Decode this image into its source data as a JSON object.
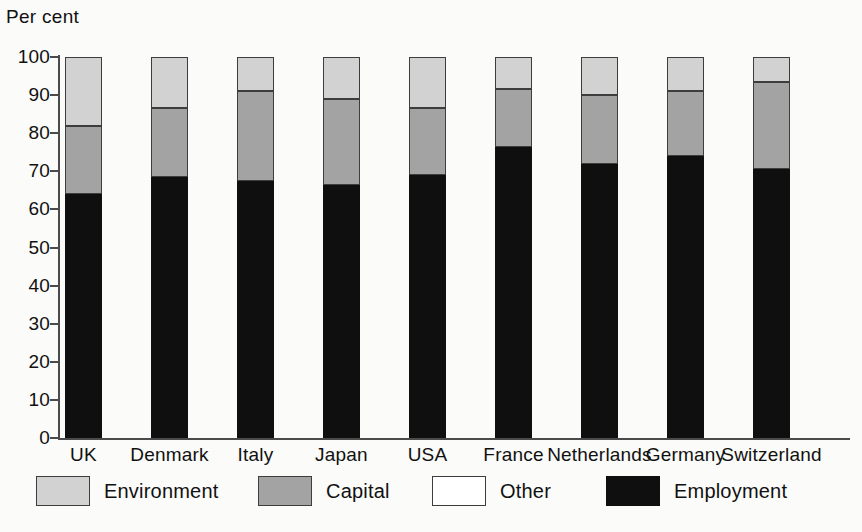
{
  "chart_data": {
    "type": "bar",
    "subtype": "stacked-vertical-100",
    "title": "",
    "xlabel": "",
    "ylabel": "Per cent",
    "ylim": [
      0,
      100
    ],
    "yticks": [
      0,
      10,
      20,
      30,
      40,
      50,
      60,
      70,
      80,
      90,
      100
    ],
    "ytick_labels": [
      "0",
      "10",
      "20",
      "30",
      "40",
      "50",
      "60",
      "70",
      "80",
      "90",
      "100"
    ],
    "grid": false,
    "legend_position": "bottom",
    "categories": [
      "UK",
      "Denmark",
      "Italy",
      "Japan",
      "USA",
      "France",
      "Netherlands",
      "Germany",
      "Switzerland"
    ],
    "series": [
      {
        "name": "Employment",
        "color": "#100f0f",
        "values": [
          64,
          68.5,
          67.5,
          66.5,
          69,
          76.5,
          72,
          74,
          70.5
        ]
      },
      {
        "name": "Capital",
        "color": "#a3a3a3",
        "values": [
          18,
          18,
          23.5,
          22.5,
          17.5,
          15,
          18,
          17,
          23
        ]
      },
      {
        "name": "Other",
        "color": "#ffffff",
        "values": [
          0,
          0,
          0,
          0,
          0,
          0,
          0,
          0,
          0
        ]
      },
      {
        "name": "Environment",
        "color": "#d2d2d2",
        "values": [
          18,
          13.5,
          9,
          11,
          13.5,
          8.5,
          10,
          9,
          6.5
        ]
      }
    ],
    "stack_order_bottom_to_top": [
      "Employment",
      "Capital",
      "Other",
      "Environment"
    ],
    "segment_tops": {
      "UK": {
        "employment": 64,
        "capital": 82,
        "other": 82,
        "environment": 100
      },
      "Denmark": {
        "employment": 68.5,
        "capital": 86.5,
        "other": 86.5,
        "environment": 100
      },
      "Italy": {
        "employment": 67.5,
        "capital": 91,
        "other": 91,
        "environment": 100
      },
      "Japan": {
        "employment": 66.5,
        "capital": 89,
        "other": 89,
        "environment": 100
      },
      "USA": {
        "employment": 69,
        "capital": 86.5,
        "other": 86.5,
        "environment": 100
      },
      "France": {
        "employment": 76.5,
        "capital": 91.5,
        "other": 91.5,
        "environment": 100
      },
      "Netherlands": {
        "employment": 72,
        "capital": 90,
        "other": 90,
        "environment": 100
      },
      "Germany": {
        "employment": 74,
        "capital": 91,
        "other": 91,
        "environment": 100
      },
      "Switzerland": {
        "employment": 70.5,
        "capital": 93.5,
        "other": 93.5,
        "environment": 100
      }
    }
  },
  "legend": {
    "items": [
      {
        "label": "Environment",
        "swatch": "environment"
      },
      {
        "label": "Capital",
        "swatch": "capital"
      },
      {
        "label": "Other",
        "swatch": "other"
      },
      {
        "label": "Employment",
        "swatch": "employment"
      }
    ]
  },
  "colors": {
    "environment": "#d2d2d2",
    "capital": "#a3a3a3",
    "other": "#ffffff",
    "employment": "#100f0f",
    "axis": "#4b4b4b",
    "text": "#111111",
    "background": "#fbfbf9"
  }
}
